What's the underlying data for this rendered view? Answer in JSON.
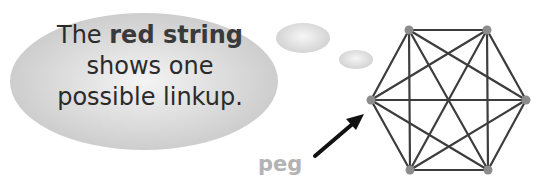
{
  "speech_bubble": {
    "line1_prefix": "The ",
    "line1_highlight": "red string",
    "line2": "shows one",
    "line3": "possible linkup."
  },
  "label": {
    "text": "peg",
    "color": "#b3b3b3"
  },
  "hexagon": {
    "pegs": [
      {
        "id": "top-left",
        "x": 409,
        "y": 30
      },
      {
        "id": "top-right",
        "x": 487,
        "y": 30
      },
      {
        "id": "right",
        "x": 526,
        "y": 100
      },
      {
        "id": "bottom-right",
        "x": 488,
        "y": 170
      },
      {
        "id": "bottom-left",
        "x": 410,
        "y": 170
      },
      {
        "id": "left",
        "x": 371,
        "y": 100
      }
    ],
    "string_color": "#3d3d3d",
    "peg_color": "#8c8c8c"
  },
  "arrow": {
    "from": [
      315,
      156
    ],
    "to": [
      362,
      116
    ],
    "color": "#111111"
  }
}
